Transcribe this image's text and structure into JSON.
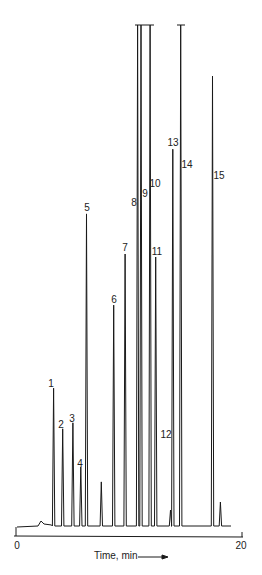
{
  "chart_data": {
    "type": "line",
    "subtype": "chromatogram",
    "title": "",
    "xlabel": "Time, min",
    "ylabel": "",
    "xlim": [
      0,
      20
    ],
    "x_ticks": [
      0,
      20
    ],
    "grid": false,
    "legend": "none",
    "peak_units": "relative detector response (arbitrary, 100 = off-scale/clipped)",
    "peaks": [
      {
        "label": "1",
        "time": 3.4,
        "height": 27.5
      },
      {
        "label": "2",
        "time": 4.2,
        "height": 19.4
      },
      {
        "label": "3",
        "time": 5.1,
        "height": 20.6
      },
      {
        "label": "4",
        "time": 5.8,
        "height": 11.8
      },
      {
        "label": "5",
        "time": 6.3,
        "height": 62.3
      },
      {
        "label": "",
        "time": 7.6,
        "height": 8.8
      },
      {
        "label": "6",
        "time": 8.7,
        "height": 44.1
      },
      {
        "label": "7",
        "time": 9.7,
        "height": 54.3
      },
      {
        "label": "8",
        "time": 10.8,
        "height": 100,
        "clipped": true
      },
      {
        "label": "9",
        "time": 11.1,
        "height": 100,
        "clipped": true
      },
      {
        "label": "10",
        "time": 11.9,
        "height": 100,
        "clipped": true
      },
      {
        "label": "11",
        "time": 12.4,
        "height": 53.7
      },
      {
        "label": "12",
        "time": 13.7,
        "height": 3.2
      },
      {
        "label": "13",
        "time": 13.9,
        "height": 75.2
      },
      {
        "label": "14",
        "time": 14.6,
        "height": 100,
        "clipped": true
      },
      {
        "label": "15",
        "time": 17.4,
        "height": 89.8
      },
      {
        "label": "",
        "time": 18.1,
        "height": 4.8
      }
    ],
    "annotations": [
      "Time, min →"
    ]
  },
  "axis": {
    "tick_0": "0",
    "tick_20": "20",
    "xlabel": "Time, min"
  },
  "plot": {
    "x0_px": 15,
    "x20_px": 242,
    "baseline_px": 526,
    "top_px": 25,
    "line_color": "#1a1a1a"
  },
  "peak_labels": [
    {
      "text": "1",
      "x": 51,
      "y": 379
    },
    {
      "text": "2",
      "x": 61,
      "y": 420
    },
    {
      "text": "3",
      "x": 72,
      "y": 414
    },
    {
      "text": "4",
      "x": 80,
      "y": 459
    },
    {
      "text": "5",
      "x": 87,
      "y": 203
    },
    {
      "text": "6",
      "x": 114,
      "y": 295
    },
    {
      "text": "7",
      "x": 125,
      "y": 243
    },
    {
      "text": "8",
      "x": 134,
      "y": 198
    },
    {
      "text": "9",
      "x": 145,
      "y": 189
    },
    {
      "text": "10",
      "x": 155,
      "y": 179
    },
    {
      "text": "11",
      "x": 157,
      "y": 247
    },
    {
      "text": "12",
      "x": 166,
      "y": 430
    },
    {
      "text": "13",
      "x": 173,
      "y": 138
    },
    {
      "text": "14",
      "x": 187,
      "y": 160
    },
    {
      "text": "15",
      "x": 219,
      "y": 171
    }
  ]
}
